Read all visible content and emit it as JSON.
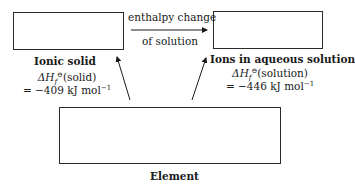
{
  "diagram": {
    "type": "enthalpy-cycle",
    "boxes": {
      "ionic_solid": {
        "label": "Ionic solid"
      },
      "ions_aqueous": {
        "label": "Ions in aqueous solution"
      },
      "element": {
        "label": "Element"
      }
    },
    "top_arrow": {
      "line1": "enthalpy change",
      "line2": "of solution"
    },
    "left_enthalpy": {
      "delta": "ΔH",
      "subscript": "f",
      "superscript": "⊖",
      "species": "(solid)",
      "value_line": "= −409 kJ mol",
      "unit_exp": "−1"
    },
    "right_enthalpy": {
      "delta": "ΔH",
      "subscript": "f",
      "superscript": "⊖",
      "species": "(solution)",
      "value_line": "= −446 kJ mol",
      "unit_exp": "−1"
    },
    "colors": {
      "line": "#2a2a2a",
      "text": "#1a1a1a",
      "background": "#ffffff"
    }
  }
}
